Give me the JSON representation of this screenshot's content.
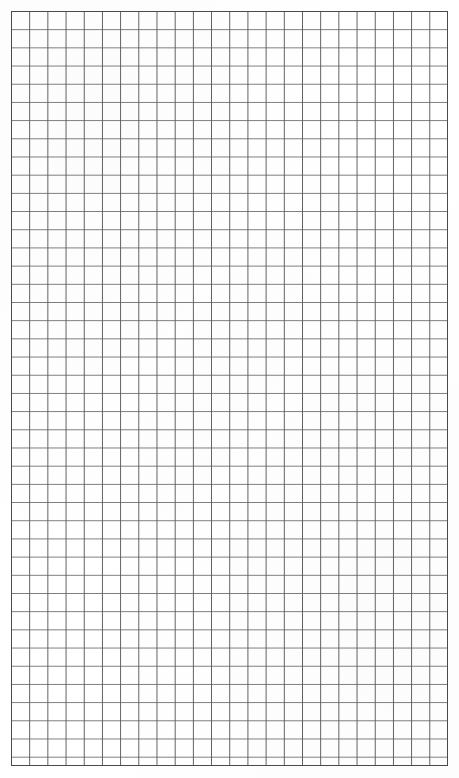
{
  "document": {
    "kind": "grid-paper",
    "title": "Blank Graph Paper Sheet",
    "caption": "",
    "page_width_px": 459,
    "page_height_px": 778,
    "background_color": "#ffffff"
  },
  "grid": {
    "origin_x_px": 11,
    "origin_y_px": 11,
    "right_edge_px": 448,
    "bottom_edge_px": 766,
    "width_px": 437,
    "height_px": 755,
    "cell_size_px": 18.2,
    "columns": 24,
    "rows": 41.5,
    "line_color": "#5c5c5c",
    "line_color_light": "#7a7a7a",
    "line_width_px": 1,
    "border_color": "#4a4a4a",
    "border_width_px": 1,
    "cell_fill": "#ffffff",
    "orientation": "portrait",
    "line_style": "solid"
  },
  "margins": {
    "top_px": 11,
    "left_px": 11,
    "right_px": 11,
    "bottom_px": 12,
    "color": "#ffffff"
  },
  "content": {
    "marks": [],
    "annotations": [],
    "text_items": [],
    "is_blank": "true"
  }
}
